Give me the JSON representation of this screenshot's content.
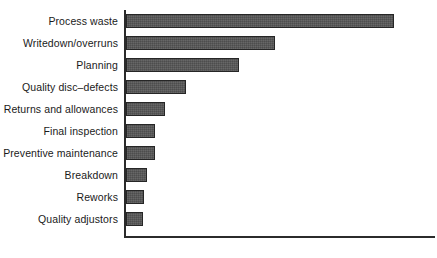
{
  "chart_data": {
    "type": "bar",
    "orientation": "horizontal",
    "title": "",
    "subtitle": "",
    "xlabel": "",
    "ylabel": "",
    "grid": false,
    "legend": null,
    "xlim": [
      0,
      100
    ],
    "axis_style": "L-shaped (left and bottom spines only)",
    "tick_labels": [],
    "categories": [
      "Process waste",
      "Writedown/overruns",
      "Planning",
      "Quality disc–defects",
      "Returns and allowances",
      "Final inspection",
      "Preventive maintenance",
      "Breakdown",
      "Reworks",
      "Quality adjustors"
    ],
    "values": [
      85.5,
      47.6,
      36.2,
      19.3,
      12.6,
      9.4,
      9.4,
      6.8,
      5.8,
      5.5
    ],
    "bar_color": "#555555",
    "bar_edge_color": "#262626",
    "axis_color": "#2b2b2b",
    "background_color": "#ffffff"
  },
  "chart": {
    "bars": [
      {
        "label": "Process waste",
        "value": 85.5,
        "pixel_width": 266
      },
      {
        "label": "Writedown/overruns",
        "value": 47.6,
        "pixel_width": 148
      },
      {
        "label": "Planning",
        "value": 36.2,
        "pixel_width": 113
      },
      {
        "label": "Quality disc–defects",
        "value": 19.3,
        "pixel_width": 60
      },
      {
        "label": "Returns and allowances",
        "value": 12.6,
        "pixel_width": 39
      },
      {
        "label": "Final inspection",
        "value": 9.4,
        "pixel_width": 29
      },
      {
        "label": "Preventive maintenance",
        "value": 9.4,
        "pixel_width": 29
      },
      {
        "label": "Breakdown",
        "value": 6.8,
        "pixel_width": 21
      },
      {
        "label": "Reworks",
        "value": 5.8,
        "pixel_width": 18
      },
      {
        "label": "Quality adjustors",
        "value": 5.5,
        "pixel_width": 17
      }
    ]
  }
}
